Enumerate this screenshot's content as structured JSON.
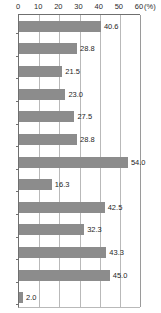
{
  "chart_data": {
    "type": "bar",
    "orientation": "horizontal",
    "title": "",
    "subtitle": "",
    "xlabel": "(%)",
    "ylabel": "",
    "unit_label": "(%)",
    "xlim": [
      0,
      60
    ],
    "x_ticks": [
      0,
      10,
      20,
      30,
      40,
      50,
      60
    ],
    "x_tick_labels": [
      "0",
      "10",
      "20",
      "30",
      "40",
      "50",
      "60"
    ],
    "grid": true,
    "grid_axis": "x",
    "legend": false,
    "legend_position": "none",
    "axis_position": "top",
    "categories": [
      "",
      "",
      "",
      "",
      "",
      "",
      "",
      "",
      "",
      "",
      "",
      "",
      ""
    ],
    "values": [
      40.6,
      28.8,
      21.5,
      23.0,
      27.5,
      28.8,
      54.0,
      16.3,
      42.5,
      32.3,
      43.3,
      45.0,
      2.0
    ],
    "value_labels": [
      "40.6",
      "28.8",
      "21.5",
      "23.0",
      "27.5",
      "28.8",
      "54.0",
      "16.3",
      "42.5",
      "32.3",
      "43.3",
      "45.0",
      "2.0"
    ],
    "series": [
      {
        "name": "",
        "values": [
          40.6,
          28.8,
          21.5,
          23.0,
          27.5,
          28.8,
          54.0,
          16.3,
          42.5,
          32.3,
          43.3,
          45.0,
          2.0
        ]
      }
    ]
  },
  "style": {
    "bar_color": "#8c8c8c",
    "grid_color": "#b9b9b9",
    "axis_color": "#6f6f6f",
    "label_color": "#262626",
    "background": "#ffffff"
  }
}
